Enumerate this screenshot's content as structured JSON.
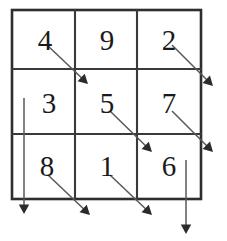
{
  "diagram": {
    "grid": {
      "rows": 3,
      "cols": 3,
      "left": 12,
      "top": 10,
      "right": 201,
      "bottom": 199,
      "col_lines": [
        75,
        137
      ],
      "row_lines": [
        69,
        134
      ],
      "border_color": "#2e2e2e",
      "line_color": "#3a3a3a",
      "background": "#ffffff"
    },
    "cells": [
      {
        "row": 0,
        "col": 0,
        "value": "4",
        "x": 28,
        "y": 26
      },
      {
        "row": 0,
        "col": 1,
        "value": "9",
        "x": 90,
        "y": 26
      },
      {
        "row": 0,
        "col": 2,
        "value": "2",
        "x": 152,
        "y": 26
      },
      {
        "row": 1,
        "col": 0,
        "value": "3",
        "x": 32,
        "y": 89
      },
      {
        "row": 1,
        "col": 1,
        "value": "5",
        "x": 90,
        "y": 89
      },
      {
        "row": 1,
        "col": 2,
        "value": "7",
        "x": 152,
        "y": 89
      },
      {
        "row": 2,
        "col": 0,
        "value": "8",
        "x": 30,
        "y": 152
      },
      {
        "row": 2,
        "col": 1,
        "value": "1",
        "x": 90,
        "y": 152
      },
      {
        "row": 2,
        "col": 2,
        "value": "6",
        "x": 152,
        "y": 152
      }
    ],
    "arrows": [
      {
        "name": "diagonal-arrow-top-left",
        "x1": 47,
        "y1": 45,
        "x2": 88,
        "y2": 84
      },
      {
        "name": "diagonal-arrow-top-right",
        "x1": 172,
        "y1": 45,
        "x2": 213,
        "y2": 86
      },
      {
        "name": "diagonal-arrow-middle-center",
        "x1": 110,
        "y1": 111,
        "x2": 152,
        "y2": 152
      },
      {
        "name": "diagonal-arrow-middle-right",
        "x1": 172,
        "y1": 111,
        "x2": 213,
        "y2": 152
      },
      {
        "name": "diagonal-arrow-bottom-left",
        "x1": 48,
        "y1": 175,
        "x2": 90,
        "y2": 215
      },
      {
        "name": "diagonal-arrow-bottom-center",
        "x1": 110,
        "y1": 175,
        "x2": 152,
        "y2": 215
      },
      {
        "name": "vertical-arrow-left-column",
        "x1": 24,
        "y1": 98,
        "x2": 24,
        "y2": 214
      },
      {
        "name": "vertical-arrow-right-column",
        "x1": 186,
        "y1": 160,
        "x2": 186,
        "y2": 234
      }
    ],
    "arrow_color": "#585858",
    "arrow_head_color": "#2b2b2b"
  }
}
